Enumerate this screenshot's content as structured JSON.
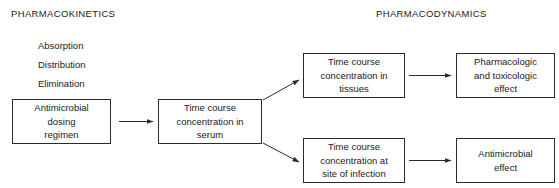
{
  "figure": {
    "sections": {
      "left_title": "PHARMACOKINETICS",
      "right_title": "PHARMACODYNAMICS"
    },
    "pk_processes": [
      {
        "label": "Absorption"
      },
      {
        "label": "Distribution"
      },
      {
        "label": "Elimination"
      }
    ],
    "nodes": {
      "dosing_regimen": {
        "lines": [
          "Antimicrobial",
          "dosing",
          "regimen"
        ]
      },
      "serum_concentration": {
        "lines": [
          "Time course",
          "concentration in",
          "serum"
        ]
      },
      "tissue_concentration": {
        "lines": [
          "Time course",
          "concentration in",
          "tissues"
        ]
      },
      "pharmacologic_effect": {
        "lines": [
          "Pharmacologic",
          "and toxicologic",
          "effect"
        ]
      },
      "site_concentration": {
        "lines": [
          "Time course",
          "concentration at",
          "site of infection"
        ]
      },
      "antimicrobial_effect": {
        "lines": [
          "Antimicrobial",
          "effect"
        ]
      }
    },
    "edges": [
      {
        "from": "dosing_regimen",
        "to": "serum_concentration",
        "style": "straight-arrow"
      },
      {
        "from": "serum_concentration",
        "to": "tissue_concentration",
        "style": "diagonal-arrow-up"
      },
      {
        "from": "serum_concentration",
        "to": "site_concentration",
        "style": "diagonal-arrow-down"
      },
      {
        "from": "tissue_concentration",
        "to": "pharmacologic_effect",
        "style": "straight-arrow"
      },
      {
        "from": "site_concentration",
        "to": "antimicrobial_effect",
        "style": "straight-arrow"
      }
    ],
    "colors": {
      "background": "#ffffff",
      "stroke": "#2b2b2b",
      "text": "#1a1a1a"
    }
  }
}
